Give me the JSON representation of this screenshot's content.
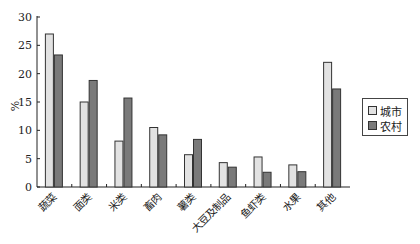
{
  "chart_data": {
    "type": "bar",
    "title": "",
    "xlabel": "",
    "ylabel": "%",
    "ylim": [
      0,
      30
    ],
    "yticks": [
      0,
      5,
      10,
      15,
      20,
      25,
      30
    ],
    "grid": false,
    "legend_position": "right",
    "categories": [
      "蔬菜",
      "面类",
      "米类",
      "畜肉",
      "薯类",
      "大豆及制品",
      "鱼虾类",
      "水果",
      "其他"
    ],
    "series": [
      {
        "name": "城市",
        "color": "#e2e2e2",
        "values": [
          27.0,
          15.0,
          8.1,
          10.5,
          5.7,
          4.3,
          5.3,
          3.9,
          22.0
        ]
      },
      {
        "name": "农村",
        "color": "#7a7a7a",
        "values": [
          23.3,
          18.8,
          15.7,
          9.2,
          8.4,
          3.5,
          2.6,
          2.7,
          17.3
        ]
      }
    ]
  },
  "legend": {
    "items": [
      {
        "label": "城市",
        "color": "#e2e2e2"
      },
      {
        "label": "农村",
        "color": "#7a7a7a"
      }
    ]
  }
}
